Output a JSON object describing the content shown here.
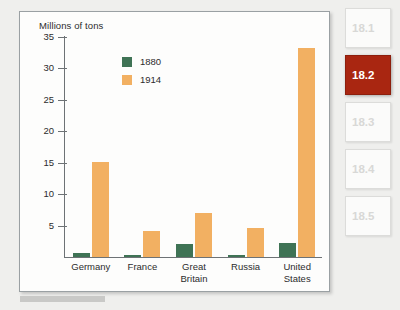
{
  "chart_data": {
    "type": "bar",
    "title": "",
    "ylabel": "Millions of tons",
    "xlabel": "",
    "ylim": [
      0,
      35
    ],
    "yticks": [
      5,
      10,
      15,
      20,
      25,
      30,
      35
    ],
    "grid": false,
    "legend_position": "inside-top-center",
    "categories": [
      "Germany",
      "France",
      "Great\nBritain",
      "Russia",
      "United\nStates"
    ],
    "series": [
      {
        "name": "1880",
        "color": "#3f7355",
        "values": [
          0.7,
          0.4,
          2.0,
          0.3,
          2.2
        ]
      },
      {
        "name": "1914",
        "color": "#f2b062",
        "values": [
          15.1,
          4.1,
          7.0,
          4.6,
          33.3
        ]
      }
    ]
  },
  "sections": {
    "items": [
      {
        "label": "18.1",
        "active": false
      },
      {
        "label": "18.2",
        "active": true
      },
      {
        "label": "18.3",
        "active": false
      },
      {
        "label": "18.4",
        "active": false
      },
      {
        "label": "18.5",
        "active": false
      }
    ]
  },
  "colors": {
    "accent": "#a92611",
    "series_1880": "#3f7355",
    "series_1914": "#f2b062",
    "axis": "#6d7275",
    "page_background": "#efefed",
    "panel_background": "#fdfdfc"
  }
}
